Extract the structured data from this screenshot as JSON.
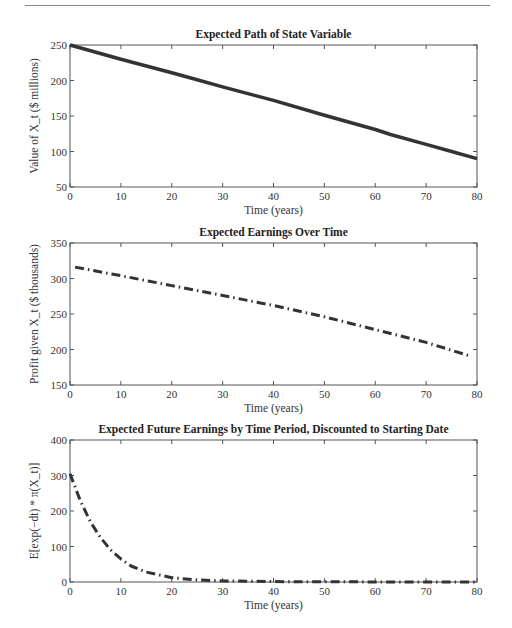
{
  "chart_data": [
    {
      "type": "line",
      "title": "Expected Path of State Variable",
      "xlabel": "Time (years)",
      "ylabel": "Value of X_t ($ millions)",
      "xlim": [
        0,
        80
      ],
      "ylim": [
        50,
        250
      ],
      "xticks": [
        0,
        10,
        20,
        30,
        40,
        50,
        60,
        70,
        80
      ],
      "yticks": [
        50,
        100,
        150,
        200,
        250
      ],
      "line_style": "solid",
      "x": [
        0,
        10,
        20,
        25,
        30,
        40,
        50,
        60,
        63,
        70,
        75,
        80
      ],
      "values": [
        250,
        230,
        211,
        201,
        191,
        172,
        151,
        131,
        124,
        110,
        100,
        90
      ]
    },
    {
      "type": "line",
      "title": "Expected Earnings Over Time",
      "xlabel": "Time (years)",
      "ylabel": "Profit given X_t ($ thousands)",
      "xlim": [
        0,
        80
      ],
      "ylim": [
        150,
        350
      ],
      "xticks": [
        0,
        10,
        20,
        30,
        40,
        50,
        60,
        70,
        80
      ],
      "yticks": [
        150,
        200,
        250,
        300,
        350
      ],
      "line_style": "dash-dot",
      "x": [
        1,
        10,
        20,
        30,
        40,
        50,
        60,
        70,
        79
      ],
      "values": [
        316,
        304,
        290,
        276,
        262,
        246,
        228,
        210,
        190
      ]
    },
    {
      "type": "line",
      "title": "Expected Future Earnings by Time Period, Discounted to Starting Date",
      "xlabel": "Time (years)",
      "ylabel": "E[exp(−dt) * π(X_t)]",
      "xlim": [
        0,
        80
      ],
      "ylim": [
        0,
        400
      ],
      "xticks": [
        0,
        10,
        20,
        30,
        40,
        50,
        60,
        70,
        80
      ],
      "yticks": [
        0,
        100,
        200,
        300,
        400
      ],
      "line_style": "dash-dot",
      "x": [
        0,
        2,
        4,
        6,
        8,
        10,
        12,
        15,
        20,
        25,
        30,
        40,
        50,
        60,
        70,
        80
      ],
      "values": [
        305,
        230,
        170,
        125,
        90,
        65,
        45,
        28,
        12,
        6,
        3,
        1,
        0.5,
        0.3,
        0.2,
        0.1
      ]
    }
  ]
}
